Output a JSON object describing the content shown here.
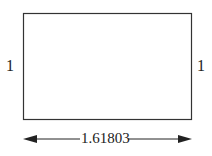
{
  "diagram": {
    "left_side_label": "1",
    "right_side_label": "1",
    "width_label": "1.61803",
    "stroke_color": "#222222",
    "background": "#ffffff"
  }
}
